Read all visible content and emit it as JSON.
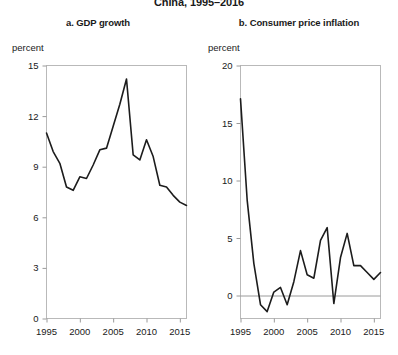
{
  "figure": {
    "main_title": "China, 1995–2016",
    "unit_label_left": "percent",
    "unit_label_right": "percent"
  },
  "chart_data": [
    {
      "type": "line",
      "panel": "a",
      "title": "a. GDP growth",
      "xlabel": "",
      "ylabel": "percent",
      "ylim": [
        0,
        15
      ],
      "xlim": [
        1995,
        2016
      ],
      "yticks": [
        0,
        3,
        6,
        9,
        12,
        15
      ],
      "xticks": [
        1995,
        2000,
        2005,
        2010,
        2015
      ],
      "grid": false,
      "legend": "none",
      "x": [
        1995,
        1996,
        1997,
        1998,
        1999,
        2000,
        2001,
        2002,
        2003,
        2004,
        2005,
        2006,
        2007,
        2008,
        2009,
        2010,
        2011,
        2012,
        2013,
        2014,
        2015,
        2016
      ],
      "values": [
        11.0,
        9.9,
        9.2,
        7.8,
        7.6,
        8.4,
        8.3,
        9.1,
        10.0,
        10.1,
        11.4,
        12.7,
        14.2,
        9.7,
        9.4,
        10.6,
        9.6,
        7.9,
        7.8,
        7.3,
        6.9,
        6.7
      ]
    },
    {
      "type": "line",
      "panel": "b",
      "title": "b. Consumer price inflation",
      "xlabel": "",
      "ylabel": "percent",
      "ylim": [
        -2,
        20
      ],
      "xlim": [
        1995,
        2016
      ],
      "yticks": [
        0,
        5,
        10,
        15,
        20
      ],
      "xticks": [
        1995,
        2000,
        2005,
        2010,
        2015
      ],
      "grid": false,
      "legend": "none",
      "zero_line": true,
      "x": [
        1995,
        1996,
        1997,
        1998,
        1999,
        2000,
        2001,
        2002,
        2003,
        2004,
        2005,
        2006,
        2007,
        2008,
        2009,
        2010,
        2011,
        2012,
        2013,
        2014,
        2015,
        2016
      ],
      "values": [
        17.1,
        8.3,
        2.8,
        -0.8,
        -1.4,
        0.3,
        0.7,
        -0.8,
        1.2,
        3.9,
        1.8,
        1.5,
        4.8,
        5.9,
        -0.7,
        3.3,
        5.4,
        2.6,
        2.6,
        2.0,
        1.4,
        2.0
      ]
    }
  ]
}
